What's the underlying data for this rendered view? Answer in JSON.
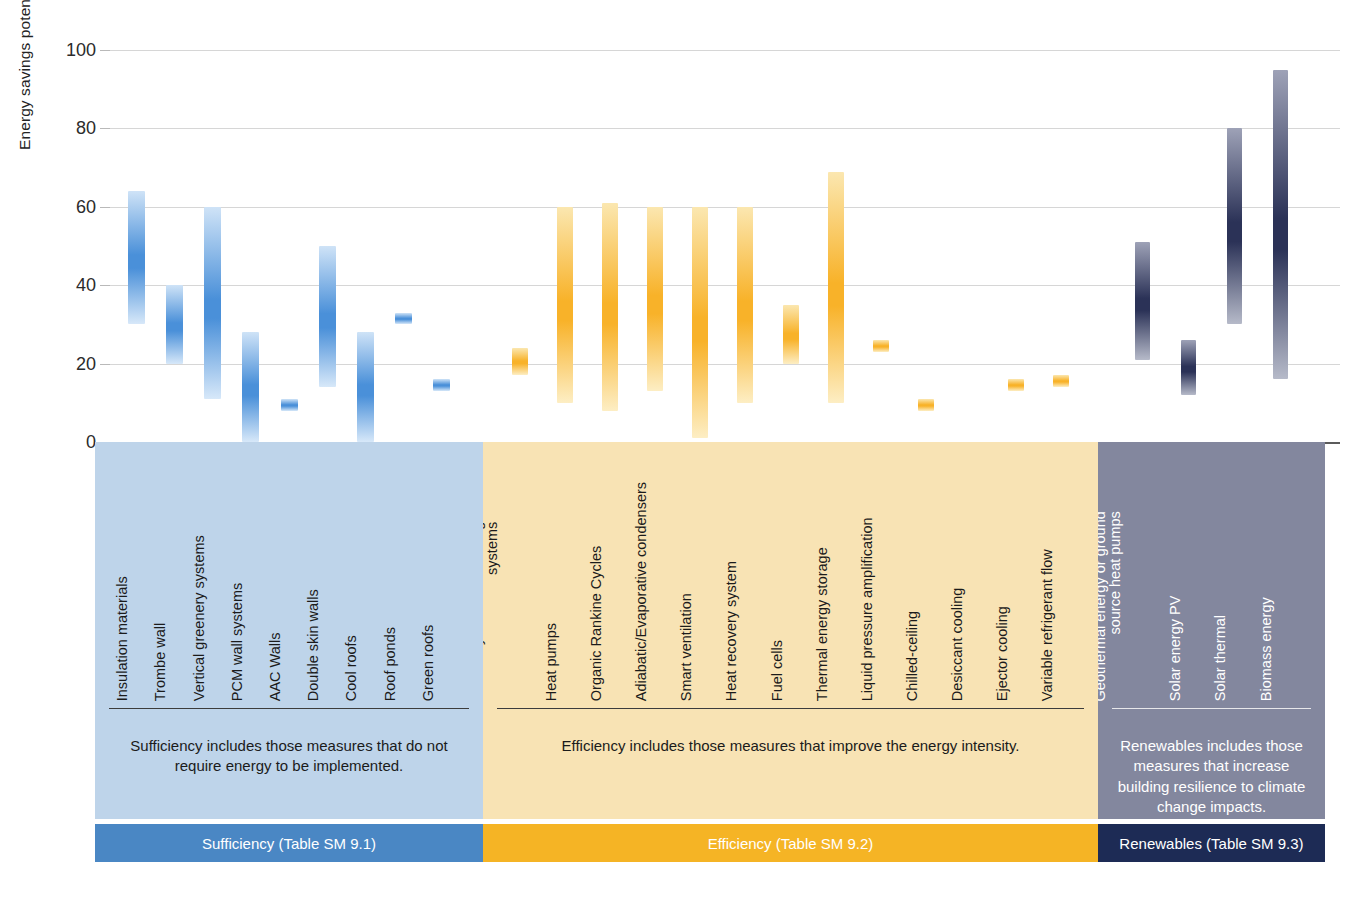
{
  "chart_data": {
    "type": "bar",
    "subtype": "floating-range-bar",
    "title": "",
    "xlabel": "",
    "ylabel": "Energy savings potential [%]",
    "ylim": [
      0,
      100
    ],
    "yticks": [
      0,
      20,
      40,
      60,
      80,
      100
    ],
    "grid": true,
    "legend_position": "bottom",
    "groups": [
      {
        "key": "sufficiency",
        "name": "Sufficiency",
        "legend_label": "Sufficiency (Table SM 9.1)",
        "description": "Sufficiency includes those measures that do not require energy to be implemented.",
        "panel_color": "#bed4ea",
        "strip_color": "#4a87c4",
        "bar_color_top": "#cfe3f7",
        "bar_color_mid": "#4a90d9",
        "bar_color_bottom": "#d7e8f9",
        "items": [
          {
            "label": "Insulation materials",
            "low": 30,
            "high": 64
          },
          {
            "label": "Trombe wall",
            "low": 20,
            "high": 40
          },
          {
            "label": "Vertical greenery systems",
            "low": 11,
            "high": 60
          },
          {
            "label": "PCM wall systems",
            "low": 0,
            "high": 28
          },
          {
            "label": "AAC Walls",
            "low": 8,
            "high": 11
          },
          {
            "label": "Double skin walls",
            "low": 14,
            "high": 50
          },
          {
            "label": "Cool roofs",
            "low": 0,
            "high": 28
          },
          {
            "label": "Roof ponds",
            "low": 30,
            "high": 33
          },
          {
            "label": "Green roofs",
            "low": 13,
            "high": 16
          }
        ]
      },
      {
        "key": "efficiency",
        "name": "Efficiency",
        "legend_label": "Efficiency (Table SM 9.2)",
        "description": "Efficiency includes those measures that improve the energy intensity.",
        "panel_color": "#f8e3b4",
        "strip_color": "#f5b425",
        "bar_color_top": "#fbe7b0",
        "bar_color_mid": "#f8b229",
        "bar_color_bottom": "#fdeec4",
        "items": [
          {
            "label": "Thermally activated building systems",
            "label_line1": "Thermally activated building",
            "label_line2": "systems",
            "low": 17,
            "high": 24
          },
          {
            "label": "Heat pumps",
            "low": 10,
            "high": 60
          },
          {
            "label": "Organic Rankine Cycles",
            "low": 8,
            "high": 61
          },
          {
            "label": "Adiabatic/Evaporative condensers",
            "low": 13,
            "high": 60
          },
          {
            "label": "Smart ventilation",
            "low": 1,
            "high": 60
          },
          {
            "label": "Heat recovery system",
            "low": 10,
            "high": 60
          },
          {
            "label": "Fuel cells",
            "low": 20,
            "high": 35
          },
          {
            "label": "Thermal energy storage",
            "low": 10,
            "high": 69
          },
          {
            "label": "Liquid pressure amplification",
            "low": 23,
            "high": 26
          },
          {
            "label": "Chilled-ceiling",
            "low": 8,
            "high": 11
          },
          {
            "label": "Desiccant cooling",
            "low": 0,
            "high": 0
          },
          {
            "label": "Ejector cooling",
            "low": 13,
            "high": 16
          },
          {
            "label": "Variable refrigerant flow",
            "low": 14,
            "high": 17
          }
        ]
      },
      {
        "key": "renewables",
        "name": "Renewables",
        "legend_label": "Renewables (Table SM 9.3)",
        "description": "Renewables includes those measures that increase building resilience to climate change impacts.",
        "panel_color": "#83879e",
        "strip_color": "#1d2b55",
        "bar_color_top": "#9ea2b7",
        "bar_color_mid": "#2b3257",
        "bar_color_bottom": "#b6bac9",
        "items": [
          {
            "label": "Geothermal energy or ground source heat pumps",
            "label_line1": "Geothermal energy or ground",
            "label_line2": "source heat pumps",
            "low": 21,
            "high": 51
          },
          {
            "label": "Solar energy PV",
            "low": 12,
            "high": 26
          },
          {
            "label": "Solar thermal",
            "low": 30,
            "high": 80
          },
          {
            "label": "Biomass energy",
            "low": 16,
            "high": 95
          }
        ]
      }
    ]
  }
}
